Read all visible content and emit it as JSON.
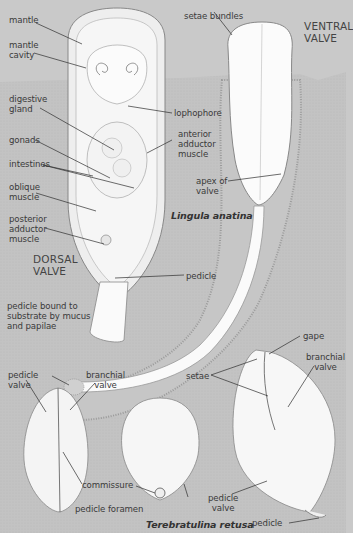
{
  "colors": {
    "background": "#c9c9c9",
    "sediment": "#bdbdbd",
    "shell": "#f7f7f7",
    "line": "#2e2e2e",
    "text": "#3a3a3a"
  },
  "species": {
    "lingula": "Lingula anatina",
    "terebratulina": "Terebratulina retusa"
  },
  "valve_headings": {
    "dorsal": "DORSAL\nVALVE",
    "ventral": "VENTRAL\nVALVE"
  },
  "lingula_labels": {
    "mantle": "mantle",
    "mantle_cavity": "mantle\ncavity",
    "digestive_gland": "digestive\ngland",
    "gonads": "gonads",
    "intestines": "intestines",
    "oblique_muscle": "oblique\nmuscle",
    "posterior_adductor": "posterior\nadductor\nmuscle",
    "lophophore": "lophophore",
    "anterior_adductor": "anterior\nadductor\nmuscle",
    "setae_bundles": "setae bundles",
    "apex_of_valve": "apex of\nvalve",
    "pedicle": "pedicle",
    "pedicle_bound": "pedicle bound to\nsubstrate by mucus\nand papilae"
  },
  "terebratulina_labels": {
    "pedicle_valve_left": "pedicle\nvalve",
    "branchial_valve_left": "branchial\nvalve",
    "commissure": "commissure",
    "pedicle_foramen": "pedicle foramen",
    "pedicle_valve_mid": "pedicle\nvalve",
    "setae": "setae",
    "gape": "gape",
    "branchial_valve_right": "branchial\nvalve",
    "pedicle_right": "pedicle"
  }
}
